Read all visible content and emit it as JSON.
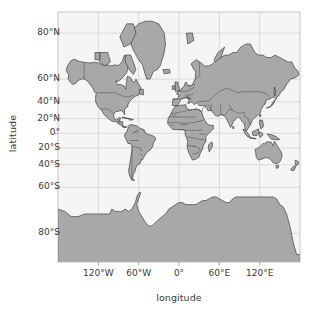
{
  "figure": {
    "type": "map",
    "projection": "mercator",
    "width": 319,
    "height": 313
  },
  "axes": {
    "x_title": "longitude",
    "y_title": "latitude",
    "x_ticks": [
      {
        "label": "120°W",
        "value": -120
      },
      {
        "label": "60°W",
        "value": -60
      },
      {
        "label": "0°",
        "value": 0
      },
      {
        "label": "60°E",
        "value": 60
      },
      {
        "label": "120°E",
        "value": 120
      }
    ],
    "y_ticks": [
      {
        "label": "80°N",
        "value": 80
      },
      {
        "label": "60°N",
        "value": 60
      },
      {
        "label": "40°N",
        "value": 40
      },
      {
        "label": "20°N",
        "value": 20
      },
      {
        "label": "0°",
        "value": 0
      },
      {
        "label": "20°S",
        "value": -20
      },
      {
        "label": "40°S",
        "value": -40
      },
      {
        "label": "60°S",
        "value": -60
      },
      {
        "label": "80°S",
        "value": -80
      }
    ],
    "xlim": [
      -180,
      180
    ],
    "ylim": [
      -85,
      84
    ],
    "grid": true
  },
  "colors": {
    "land": "#a8a8a8",
    "ocean": "#f5f5f5",
    "coastline": "#2b2b2b",
    "border": "#4a4a4a",
    "grid": "#cfcfcf",
    "text": "#3a3a3a",
    "page": "#ffffff"
  },
  "plot_box": {
    "left": 58,
    "top": 12,
    "right": 300,
    "bottom": 262
  },
  "chart_data": {
    "type": "map",
    "title": "",
    "xlabel": "longitude",
    "ylabel": "latitude",
    "projection": "mercator",
    "xlim": [
      -180,
      180
    ],
    "ylim": [
      -85,
      84
    ],
    "grid": true,
    "legend": null,
    "landmasses": [
      "North America",
      "Greenland",
      "Canadian Arctic Archipelago",
      "South America",
      "Africa",
      "Europe",
      "Asia",
      "Australia",
      "New Guinea",
      "Indonesia",
      "New Zealand",
      "Antarctica",
      "Iceland",
      "British Isles",
      "Japan",
      "Madagascar"
    ],
    "features": {
      "country_borders": true,
      "coastlines": true
    }
  },
  "regions": {
    "eurasia_africa": "M 526 96 L 534 90 L 546 86 L 560 84 L 576 82 L 592 80 L 610 76 L 628 72 L 646 68 L 664 64 L 682 62 L 700 60 L 716 58 L 730 58 L 742 60 L 752 64 L 758 70 L 762 78 L 764 86 L 762 94 L 756 100 L 748 104 L 744 110 L 748 116 L 756 118 L 766 118 L 776 116 L 786 114 L 796 114 L 804 118 L 808 124 L 806 132 L 800 138 L 792 142 L 784 146 L 778 152 L 776 160 L 778 168 L 782 174 L 786 180 L 786 188 L 782 194 L 774 198 L 766 200 L 758 202 L 752 206 L 748 212 L 746 220 L 744 228 L 740 234 L 734 238 L 726 240 L 718 240 L 710 238 L 702 236 L 694 236 L 688 240 L 684 246 L 682 254 L 680 262 L 676 268 L 670 272 L 662 274 L 654 274 L 646 272 L 640 268 L 636 262 L 634 254 L 632 246 L 628 240 L 622 236 L 614 234 L 606 234 L 598 236 L 592 240 L 588 246 L 586 254 L 586 262 L 588 270 L 590 278 L 590 286 L 588 294 L 584 300 L 578 304 L 570 306 L 562 306 L 554 304 L 548 300 L 544 294 L 542 286 L 542 278 L 544 270 L 546 262 L 546 254 L 544 246 L 540 240 L 534 236 L 528 232 L 524 226 L 522 218 L 522 210 L 524 202 L 526 194 L 526 186 L 524 178 L 520 172 L 514 168 L 508 164 L 504 158 L 502 150 L 502 142 L 504 134 L 508 128 L 514 124 L 520 120 L 524 114 L 526 106 Z",
    "north_america": "M 112 120 L 120 112 L 130 106 L 142 102 L 156 100 L 170 98 L 184 96 L 198 94 L 212 92 L 226 92 L 238 94 L 248 98 L 256 104 L 262 112 L 266 120 L 268 130 L 268 140 L 266 150 L 262 158 L 256 164 L 248 168 L 240 172 L 234 178 L 230 186 L 228 194 L 228 202 L 226 210 L 222 216 L 216 220 L 208 222 L 200 222 L 192 220 L 186 216 L 182 210 L 180 202 L 178 194 L 174 188 L 168 184 L 160 182 L 152 182 L 144 184 L 138 188 L 134 194 L 130 200 L 124 204 L 116 206 L 108 206 L 100 204 L 94 200 L 90 194 L 88 186 L 88 178 L 90 170 L 94 164 L 100 160 L 106 156 L 110 150 L 112 142 L 112 132 Z",
    "south_america": "M 238 248 L 246 242 L 256 238 L 266 236 L 276 236 L 286 238 L 294 242 L 300 248 L 304 256 L 306 264 L 306 272 L 304 280 L 300 288 L 296 296 L 292 304 L 288 312 L 284 320 L 280 328 L 276 336 L 272 344 L 268 352 L 264 358 L 258 362 L 252 364 L 246 362 L 242 358 L 240 352 L 240 344 L 242 336 L 244 328 L 244 320 L 242 312 L 238 306 L 234 298 L 232 290 L 232 282 L 234 274 L 236 266 L 238 258 Z",
    "australia": "M 786 300 L 796 294 L 808 290 L 822 288 L 836 288 L 850 290 L 862 294 L 872 300 L 878 308 L 880 316 L 878 324 L 872 330 L 864 334 L 854 336 L 844 336 L 834 334 L 824 332 L 814 332 L 804 334 L 796 332 L 790 328 L 786 322 L 784 314 L 784 306 Z",
    "antarctica": "M 0 470 L 40 462 L 90 456 L 140 452 L 190 450 L 240 450 L 290 452 L 340 454 L 390 454 L 440 452 L 490 448 L 540 444 L 590 442 L 640 442 L 690 444 L 740 448 L 790 452 L 840 454 L 890 454 L 940 452 L 990 450 L 1040 450 L 1080 452 L 1080 560 L 0 560 Z",
    "greenland": "M 300 56 L 312 50 L 326 46 L 340 44 L 352 46 L 362 52 L 368 60 L 370 70 L 368 80 L 364 90 L 358 100 L 352 110 L 346 118 L 338 124 L 330 126 L 322 124 L 316 118 L 312 110 L 308 100 L 304 90 L 300 80 L 298 70 Z"
  }
}
